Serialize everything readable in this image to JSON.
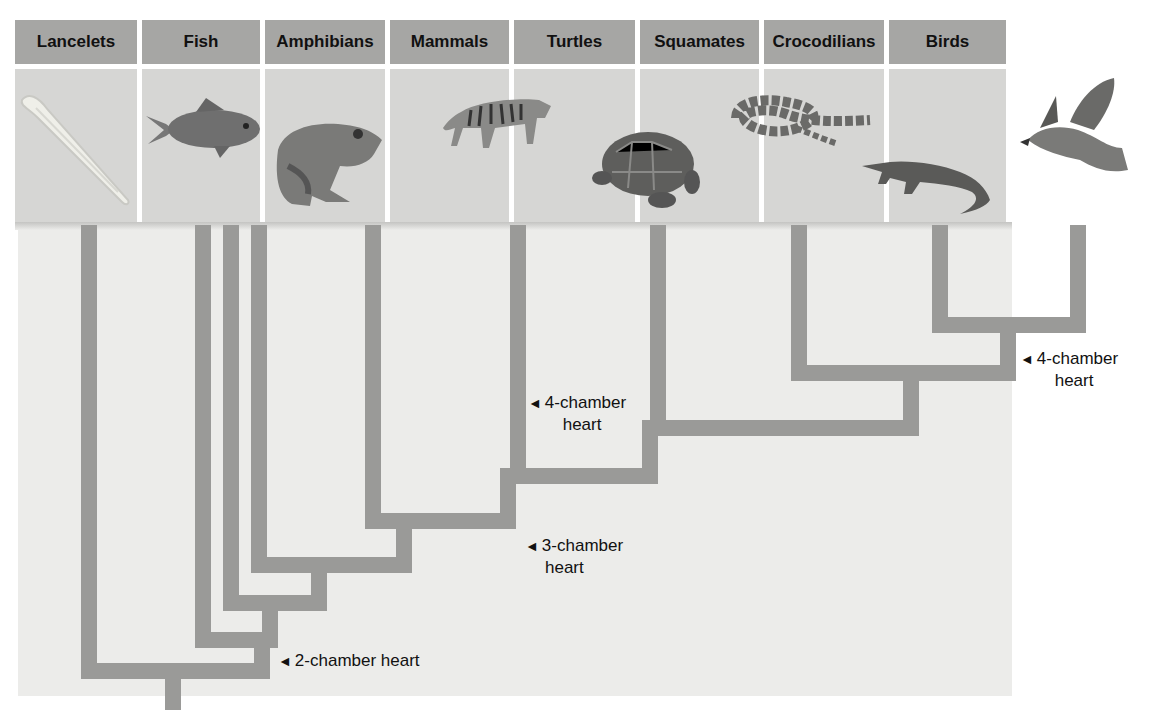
{
  "figure": {
    "title": "",
    "taxa": [
      {
        "name": "Lancelets",
        "icon": "lancelet-icon"
      },
      {
        "name": "Fish",
        "icon": "fish-icon"
      },
      {
        "name": "Amphibians",
        "icon": "frog-icon"
      },
      {
        "name": "Mammals",
        "icon": "tiger-icon"
      },
      {
        "name": "Turtles",
        "icon": "turtle-icon"
      },
      {
        "name": "Squamates",
        "icon": "snake-icon"
      },
      {
        "name": "Crocodilians",
        "icon": "alligator-icon"
      },
      {
        "name": "Birds",
        "icon": "hawk-icon"
      }
    ],
    "annotations": [
      {
        "arrow": "◄",
        "line1": "2-chamber heart",
        "line2": ""
      },
      {
        "arrow": "◄",
        "line1": "3-chamber",
        "line2": "heart"
      },
      {
        "arrow": "◄",
        "line1": "4-chamber",
        "line2": "heart"
      },
      {
        "arrow": "◄",
        "line1": "4-chamber",
        "line2": "heart"
      }
    ],
    "colors": {
      "header": "#a6a6a4",
      "image_bg": "#d6d6d4",
      "branch": "#9a9a98",
      "panel": "#ececea"
    }
  }
}
